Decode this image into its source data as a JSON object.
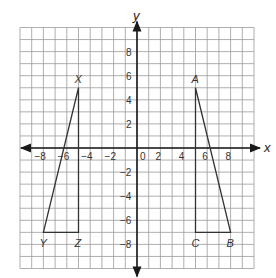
{
  "diagram": {
    "axes": {
      "x_label": "x",
      "y_label": "y",
      "range": [
        -10,
        10
      ],
      "x_ticks": [
        -8,
        -6,
        -4,
        -2,
        0,
        2,
        4,
        6,
        8
      ],
      "x_tick_labels": [
        "−8",
        "−6",
        "−4",
        "−2",
        "0",
        "2",
        "4",
        "6",
        "8"
      ],
      "y_ticks": [
        8,
        6,
        4,
        2,
        -2,
        -4,
        -6,
        -8
      ],
      "y_tick_labels": [
        "8",
        "6",
        "4",
        "2",
        "−2",
        "−4",
        "−6",
        "−8"
      ]
    },
    "triangles": [
      {
        "name": "XYZ",
        "vertices": [
          {
            "label": "X",
            "x": -5,
            "y": 5
          },
          {
            "label": "Y",
            "x": -8,
            "y": -7
          },
          {
            "label": "Z",
            "x": -5,
            "y": -7
          }
        ]
      },
      {
        "name": "ABC",
        "vertices": [
          {
            "label": "A",
            "x": 5,
            "y": 5
          },
          {
            "label": "B",
            "x": 8,
            "y": -7
          },
          {
            "label": "C",
            "x": 5,
            "y": -7
          }
        ]
      }
    ],
    "colors": {
      "grid": "#9a9a9a",
      "axis": "#1a1a1a",
      "shape": "#333333"
    }
  }
}
